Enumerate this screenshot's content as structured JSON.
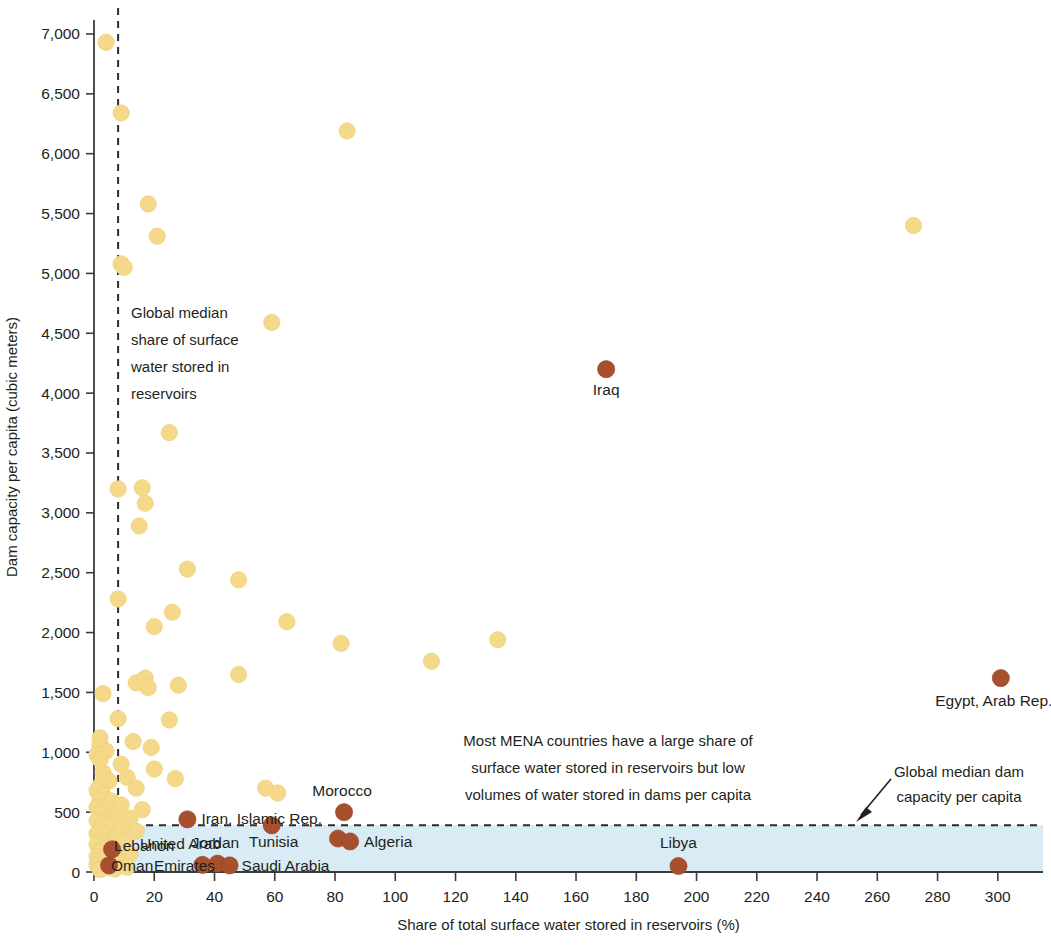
{
  "chart_data": {
    "type": "scatter",
    "title": "",
    "xlabel": "Share of total surface water stored in reservoirs (%)",
    "ylabel": "Dam capacity per capita (cubic meters)",
    "xlim": [
      0,
      315
    ],
    "ylim": [
      0,
      7100
    ],
    "xticks": [
      0,
      20,
      40,
      60,
      80,
      100,
      120,
      140,
      160,
      180,
      200,
      220,
      240,
      260,
      280,
      300
    ],
    "xtick_labels": [
      "0",
      "20",
      "40",
      "60",
      "80",
      "100",
      "120",
      "140",
      "160",
      "180",
      "200",
      "220",
      "240",
      "260",
      "280",
      "300"
    ],
    "yticks": [
      0,
      500,
      1000,
      1500,
      2000,
      2500,
      3000,
      3500,
      4000,
      4500,
      5000,
      5500,
      6000,
      6500,
      7000
    ],
    "ytick_labels": [
      "0",
      "500",
      "1,000",
      "1,500",
      "2,000",
      "2,500",
      "3,000",
      "3,500",
      "4,000",
      "4,500",
      "5,000",
      "5,500",
      "6,000",
      "6,500",
      "7,000"
    ],
    "grid": false,
    "legend": "none",
    "colors": {
      "other_countries": "#f5d98a",
      "mena_countries": "#a8502d",
      "band": "#d9ecf5",
      "reference_line": "#2b2b2b",
      "text": "#231f20"
    },
    "reference_lines": [
      {
        "name": "global-median-share",
        "orientation": "vertical",
        "value": 8,
        "style": "dashed",
        "label": "Global median share of surface water stored in reservoirs"
      },
      {
        "name": "global-median-dam-capacity",
        "orientation": "horizontal",
        "value": 390,
        "style": "dashed",
        "label": "Global median dam capacity per capita"
      }
    ],
    "shaded_band": {
      "name": "low-dam-capacity-band",
      "y_from": 0,
      "y_to": 390,
      "x_from": 0,
      "x_to": 315
    },
    "series": [
      {
        "name": "Other countries",
        "color": "#f5d98a",
        "points": [
          {
            "x": 4,
            "y": 6930
          },
          {
            "x": 9,
            "y": 6340
          },
          {
            "x": 84,
            "y": 6190
          },
          {
            "x": 18,
            "y": 5580
          },
          {
            "x": 272,
            "y": 5400
          },
          {
            "x": 21,
            "y": 5310
          },
          {
            "x": 9,
            "y": 5080
          },
          {
            "x": 10,
            "y": 5050
          },
          {
            "x": 59,
            "y": 4590
          },
          {
            "x": 25,
            "y": 3670
          },
          {
            "x": 8,
            "y": 3200
          },
          {
            "x": 16,
            "y": 3210
          },
          {
            "x": 17,
            "y": 3080
          },
          {
            "x": 15,
            "y": 2890
          },
          {
            "x": 31,
            "y": 2530
          },
          {
            "x": 48,
            "y": 2440
          },
          {
            "x": 8,
            "y": 2280
          },
          {
            "x": 26,
            "y": 2170
          },
          {
            "x": 64,
            "y": 2090
          },
          {
            "x": 20,
            "y": 2050
          },
          {
            "x": 82,
            "y": 1910
          },
          {
            "x": 134,
            "y": 1940
          },
          {
            "x": 112,
            "y": 1760
          },
          {
            "x": 48,
            "y": 1650
          },
          {
            "x": 14,
            "y": 1580
          },
          {
            "x": 17,
            "y": 1620
          },
          {
            "x": 18,
            "y": 1540
          },
          {
            "x": 28,
            "y": 1560
          },
          {
            "x": 3,
            "y": 1490
          },
          {
            "x": 8,
            "y": 1280
          },
          {
            "x": 25,
            "y": 1270
          },
          {
            "x": 2,
            "y": 1120
          },
          {
            "x": 2,
            "y": 1060
          },
          {
            "x": 13,
            "y": 1090
          },
          {
            "x": 19,
            "y": 1040
          },
          {
            "x": 1,
            "y": 980
          },
          {
            "x": 4,
            "y": 1010
          },
          {
            "x": 2,
            "y": 940
          },
          {
            "x": 9,
            "y": 900
          },
          {
            "x": 20,
            "y": 860
          },
          {
            "x": 3,
            "y": 830
          },
          {
            "x": 11,
            "y": 790
          },
          {
            "x": 27,
            "y": 780
          },
          {
            "x": 5,
            "y": 760
          },
          {
            "x": 2,
            "y": 720
          },
          {
            "x": 14,
            "y": 700
          },
          {
            "x": 1,
            "y": 680
          },
          {
            "x": 3,
            "y": 640
          },
          {
            "x": 57,
            "y": 700
          },
          {
            "x": 61,
            "y": 660
          },
          {
            "x": 2,
            "y": 600
          },
          {
            "x": 6,
            "y": 590
          },
          {
            "x": 9,
            "y": 560
          },
          {
            "x": 1,
            "y": 540
          },
          {
            "x": 4,
            "y": 520
          },
          {
            "x": 16,
            "y": 520
          },
          {
            "x": 2,
            "y": 480
          },
          {
            "x": 7,
            "y": 470
          },
          {
            "x": 12,
            "y": 450
          },
          {
            "x": 1,
            "y": 430
          },
          {
            "x": 3,
            "y": 410
          },
          {
            "x": 5,
            "y": 390
          },
          {
            "x": 9,
            "y": 370
          },
          {
            "x": 2,
            "y": 350
          },
          {
            "x": 14,
            "y": 340
          },
          {
            "x": 1,
            "y": 320
          },
          {
            "x": 4,
            "y": 300
          },
          {
            "x": 7,
            "y": 280
          },
          {
            "x": 2,
            "y": 260
          },
          {
            "x": 10,
            "y": 250
          },
          {
            "x": 1,
            "y": 230
          },
          {
            "x": 5,
            "y": 210
          },
          {
            "x": 3,
            "y": 190
          },
          {
            "x": 8,
            "y": 180
          },
          {
            "x": 2,
            "y": 160
          },
          {
            "x": 12,
            "y": 150
          },
          {
            "x": 1,
            "y": 130
          },
          {
            "x": 4,
            "y": 120
          },
          {
            "x": 6,
            "y": 100
          },
          {
            "x": 2,
            "y": 80
          },
          {
            "x": 9,
            "y": 70
          },
          {
            "x": 1,
            "y": 60
          },
          {
            "x": 3,
            "y": 45
          },
          {
            "x": 5,
            "y": 35
          },
          {
            "x": 7,
            "y": 25
          },
          {
            "x": 2,
            "y": 20
          },
          {
            "x": 11,
            "y": 40
          }
        ]
      },
      {
        "name": "MENA countries",
        "color": "#a8502d",
        "points": [
          {
            "x": 170,
            "y": 4200,
            "label": "Iraq",
            "label_pos": "below"
          },
          {
            "x": 301,
            "y": 1620,
            "label": "Egypt, Arab Rep.",
            "label_pos": "below"
          },
          {
            "x": 83,
            "y": 500,
            "label": "Morocco",
            "label_pos": "above"
          },
          {
            "x": 31,
            "y": 440,
            "label": "Iran, Islamic Rep.",
            "label_pos": "right"
          },
          {
            "x": 81,
            "y": 280,
            "label": "Algeria",
            "label_pos": "right"
          },
          {
            "x": 85,
            "y": 255,
            "label": "",
            "label_pos": "none"
          },
          {
            "x": 59,
            "y": 390,
            "label": "Tunisia",
            "label_pos": "below"
          },
          {
            "x": 194,
            "y": 50,
            "label": "Libya",
            "label_pos": "above"
          },
          {
            "x": 41,
            "y": 70,
            "label": "Jordan",
            "label_pos": "above"
          },
          {
            "x": 45,
            "y": 55,
            "label": "Saudi Arabia",
            "label_pos": "right"
          },
          {
            "x": 36,
            "y": 60,
            "label": "United Arab Emirates",
            "label_pos": "left"
          },
          {
            "x": 5,
            "y": 55,
            "label": "Oman",
            "label_pos": "left"
          },
          {
            "x": 6,
            "y": 190,
            "label": "Lebanon",
            "label_pos": "left"
          }
        ]
      }
    ],
    "annotations": [
      {
        "name": "median-share-annotation",
        "text_lines": [
          "Global median",
          "share of surface",
          "water stored in",
          "reservoirs"
        ]
      },
      {
        "name": "mena-summary-annotation",
        "text_lines": [
          "Most MENA countries have a large share of",
          "surface water stored in reservoirs but low",
          "volumes of water stored in dams per capita"
        ]
      },
      {
        "name": "median-capacity-annotation",
        "text_lines": [
          "Global median dam",
          "capacity per capita"
        ]
      }
    ],
    "country_labels": {
      "iraq": "Iraq",
      "egypt": "Egypt, Arab Rep.",
      "morocco": "Morocco",
      "iran": "Iran, Islamic Rep.",
      "algeria": "Algeria",
      "tunisia": "Tunisia",
      "libya": "Libya",
      "jordan": "Jordan",
      "saudi_arabia": "Saudi Arabia",
      "uae_line1": "United Arab",
      "uae_line2": "Emirates",
      "oman": "Oman",
      "lebanon": "Lebanon"
    }
  }
}
